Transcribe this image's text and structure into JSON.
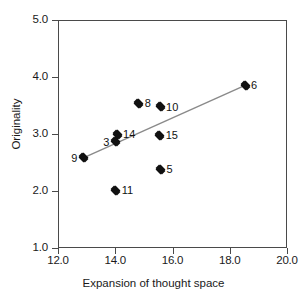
{
  "chart_data": {
    "type": "scatter",
    "title": "",
    "xlabel": "Expansion of thought space",
    "ylabel": "Originality",
    "xlim": [
      12.0,
      20.0
    ],
    "ylim": [
      1.0,
      5.0
    ],
    "xticks": [
      "12.0",
      "14.0",
      "16.0",
      "18.0",
      "20.0"
    ],
    "xtick_values": [
      12.0,
      14.0,
      16.0,
      18.0,
      20.0
    ],
    "yticks": [
      "5.0",
      "4.0",
      "3.0",
      "2.0",
      "1.0"
    ],
    "ytick_values": [
      5.0,
      4.0,
      3.0,
      2.0,
      1.0
    ],
    "grid": false,
    "legend": false,
    "points": [
      {
        "label": "9",
        "x": 12.85,
        "y": 2.6,
        "label_side": "left"
      },
      {
        "label": "3",
        "x": 13.97,
        "y": 2.88,
        "label_side": "left"
      },
      {
        "label": "14",
        "x": 14.03,
        "y": 3.01,
        "label_side": "right"
      },
      {
        "label": "11",
        "x": 13.98,
        "y": 2.03,
        "label_side": "right"
      },
      {
        "label": "8",
        "x": 14.79,
        "y": 3.56,
        "label_side": "right"
      },
      {
        "label": "10",
        "x": 15.53,
        "y": 3.5,
        "label_side": "right"
      },
      {
        "label": "15",
        "x": 15.52,
        "y": 3.0,
        "label_side": "right"
      },
      {
        "label": "5",
        "x": 15.55,
        "y": 2.4,
        "label_side": "right"
      },
      {
        "label": "6",
        "x": 18.5,
        "y": 3.87,
        "label_side": "right"
      }
    ],
    "trendline": {
      "x0": 12.85,
      "y0": 2.6,
      "x1": 18.5,
      "y1": 3.87,
      "color": "#8a8a8a"
    },
    "marker_color": "#111111",
    "axis_color": "#4a4a4a"
  }
}
